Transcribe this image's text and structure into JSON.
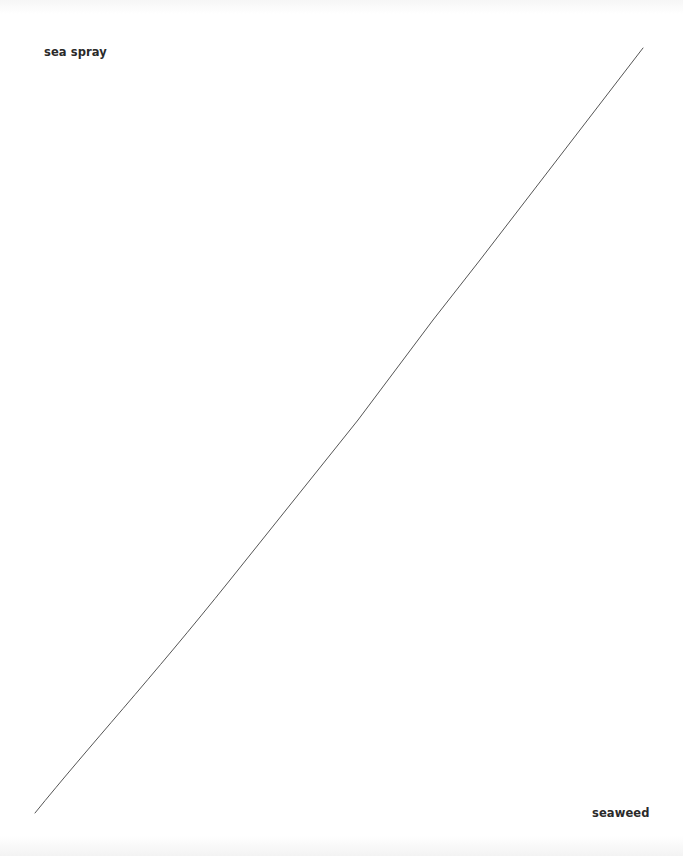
{
  "diagram": {
    "type": "two-pole connector",
    "nodes": [
      {
        "id": "top",
        "label": "sea spray",
        "position": "top-left"
      },
      {
        "id": "bottom",
        "label": "seaweed",
        "position": "bottom-right"
      }
    ],
    "connector": {
      "from": "bottom",
      "to": "top",
      "start": [
        35,
        813
      ],
      "end": [
        643,
        48
      ],
      "color": "#555555",
      "width": 1
    }
  }
}
